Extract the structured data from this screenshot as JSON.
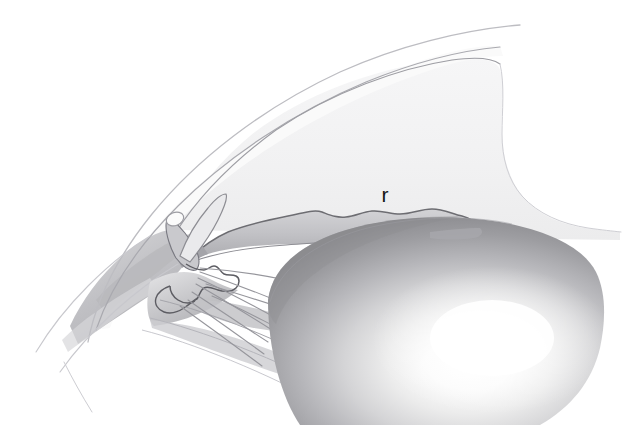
{
  "figure": {
    "kind": "anatomical-illustration",
    "background_color": "#ffffff",
    "width": 629,
    "height": 425
  },
  "labels": [
    {
      "id": "iris-label",
      "text": "r",
      "x": 385,
      "y": 202,
      "color": "#141414",
      "font_size": 21
    }
  ],
  "structures": [
    {
      "name": "cornea-outer-surface",
      "type": "outline-curve",
      "stroke": "#b9b9bd"
    },
    {
      "name": "cornea-inner-surface",
      "type": "outline-curve",
      "stroke": "#a8a8ad"
    },
    {
      "name": "anterior-chamber",
      "type": "filled-region",
      "fill": "#f2f2f3"
    },
    {
      "name": "sclera-outline",
      "type": "outline-curve",
      "stroke": "#c2c2c6"
    },
    {
      "name": "limbus-wedge",
      "type": "filled-region",
      "fill": "#cfcfd2"
    },
    {
      "name": "schlemms-canal",
      "type": "small-oval",
      "stroke": "#9a9a9e"
    },
    {
      "name": "iris",
      "type": "wavy-band",
      "fill": "#c4c4c7",
      "stroke": "#6f6f73"
    },
    {
      "name": "ciliary-body",
      "type": "filled-region",
      "fill": "#b4b4b8",
      "stroke": "#6a6a6e"
    },
    {
      "name": "ciliary-processes",
      "type": "scalloped-edge",
      "stroke": "#5f5f63"
    },
    {
      "name": "zonular-fibers",
      "type": "radiating-lines",
      "stroke": "#9d9da1",
      "count": 9
    },
    {
      "name": "lens",
      "type": "gradient-ellipse",
      "fill_center": "#ffffff",
      "fill_edge": "#8d8d91"
    },
    {
      "name": "lens-highlight",
      "center_x": 492,
      "center_y": 338
    }
  ],
  "palette": {
    "paper": "#ffffff",
    "faint_line": "#c4c4c8",
    "mid_line": "#8b8b90",
    "dark_line": "#5c5c61",
    "chamber_fill": "#f2f2f3",
    "tissue_light": "#dcdcde",
    "tissue_mid": "#bcbcc0",
    "tissue_dark": "#9a9a9e",
    "lens_core": "#ffffff",
    "lens_rim": "#8a8a8e",
    "label_ink": "#141414"
  }
}
